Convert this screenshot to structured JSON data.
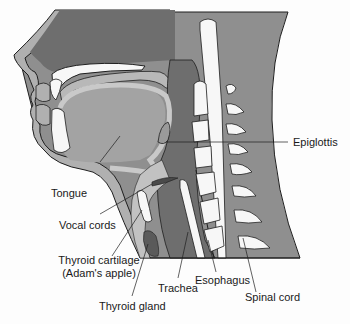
{
  "diagram": {
    "colors": {
      "background": "#fdfdfd",
      "skin_outer": "#a9a9a9",
      "tissue_dark": "#6e6e6e",
      "tissue_mid": "#8f8f8f",
      "tongue": "#9a9a9a",
      "tongue_inner": "#a3a3a3",
      "bone_light": "#c2c2c2",
      "white": "#f7f7f7",
      "outline": "#1e1e1e",
      "thyroid": "#5a5a5a"
    },
    "labels": [
      {
        "id": "epiglottis",
        "text": "Epiglottis"
      },
      {
        "id": "tongue",
        "text": "Tongue"
      },
      {
        "id": "vocal_cords",
        "text": "Vocal cords"
      },
      {
        "id": "thyroid_cartilage",
        "text": "Thyroid cartilage",
        "sub": "(Adam's apple)"
      },
      {
        "id": "thyroid_gland",
        "text": "Thyroid gland"
      },
      {
        "id": "trachea",
        "text": "Trachea"
      },
      {
        "id": "esophagus",
        "text": "Esophagus"
      },
      {
        "id": "spinal_cord",
        "text": "Spinal cord"
      }
    ]
  }
}
